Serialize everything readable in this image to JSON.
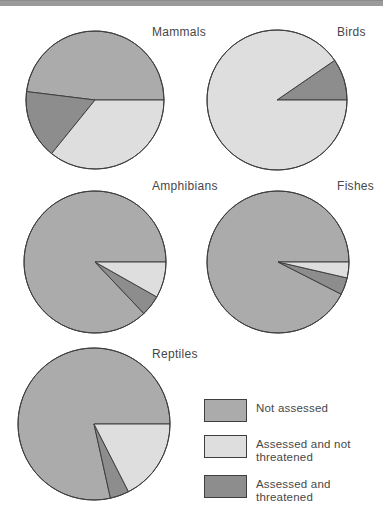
{
  "figure": {
    "top_bar_color": "#9B9B9B"
  },
  "colors": {
    "not_assessed": "#ABABAB",
    "assessed_not_threatened": "#DEDEDE",
    "assessed_threatened": "#8D8D8D",
    "outline": "#3F3F3F",
    "text": "#474747",
    "background": "#FFFFFF"
  },
  "legend": {
    "items": [
      {
        "key": "not_assessed",
        "label": "Not assessed",
        "color": "#ABABAB"
      },
      {
        "key": "assessed_not_threatened",
        "label": "Assessed and not threatened",
        "color": "#DEDEDE"
      },
      {
        "key": "assessed_threatened",
        "label": "Assessed and threatened",
        "color": "#8D8D8D"
      }
    ]
  },
  "chart_data": {
    "type": "pie",
    "title": "",
    "legend_position": "bottom-right",
    "grid": false,
    "categories": [
      "Not assessed",
      "Assessed and not threatened",
      "Assessed and threatened"
    ],
    "pies": [
      {
        "title": "Mammals",
        "slices": [
          {
            "key": "not_assessed",
            "category": "Not assessed",
            "pct": 48.1,
            "start_deg": 0,
            "end_deg": 173
          },
          {
            "key": "assessed_threatened",
            "category": "Assessed and threatened",
            "pct": 16.1,
            "start_deg": 173,
            "end_deg": 231
          },
          {
            "key": "assessed_not_threatened",
            "category": "Assessed and not threatened",
            "pct": 35.8,
            "start_deg": 231,
            "end_deg": 360
          }
        ]
      },
      {
        "title": "Birds",
        "slices": [
          {
            "key": "assessed_threatened",
            "category": "Assessed and threatened",
            "pct": 9.6,
            "start_deg": 0,
            "end_deg": 34.5
          },
          {
            "key": "assessed_not_threatened",
            "category": "Assessed and not threatened",
            "pct": 90.4,
            "start_deg": 34.5,
            "end_deg": 360
          }
        ]
      },
      {
        "title": "Amphibians",
        "slices": [
          {
            "key": "not_assessed",
            "category": "Not assessed",
            "pct": 87.1,
            "start_deg": 0,
            "end_deg": 313.5
          },
          {
            "key": "assessed_threatened",
            "category": "Assessed and threatened",
            "pct": 4.7,
            "start_deg": 313.5,
            "end_deg": 330.5
          },
          {
            "key": "assessed_not_threatened",
            "category": "Assessed and not threatened",
            "pct": 8.2,
            "start_deg": 330.5,
            "end_deg": 360
          }
        ]
      },
      {
        "title": "Fishes",
        "slices": [
          {
            "key": "not_assessed",
            "category": "Not assessed",
            "pct": 92.5,
            "start_deg": 0,
            "end_deg": 333
          },
          {
            "key": "assessed_threatened",
            "category": "Assessed and threatened",
            "pct": 3.9,
            "start_deg": 333,
            "end_deg": 347
          },
          {
            "key": "assessed_not_threatened",
            "category": "Assessed and not threatened",
            "pct": 3.6,
            "start_deg": 347,
            "end_deg": 360
          }
        ]
      },
      {
        "title": "Reptiles",
        "slices": [
          {
            "key": "not_assessed",
            "category": "Not assessed",
            "pct": 78.5,
            "start_deg": 0,
            "end_deg": 282.5
          },
          {
            "key": "assessed_threatened",
            "category": "Assessed and threatened",
            "pct": 4.0,
            "start_deg": 282.5,
            "end_deg": 297
          },
          {
            "key": "assessed_not_threatened",
            "category": "Assessed and not threatened",
            "pct": 17.5,
            "start_deg": 297,
            "end_deg": 360
          }
        ]
      }
    ]
  }
}
